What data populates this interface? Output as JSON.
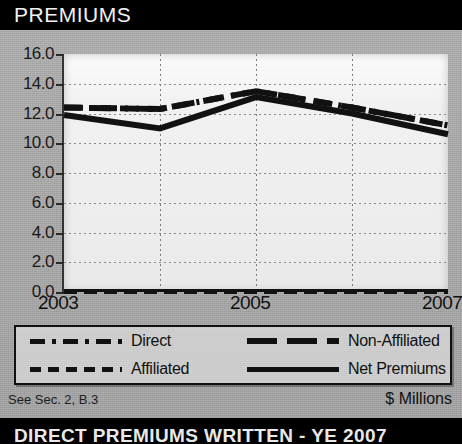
{
  "header": {
    "title": "PREMIUMS"
  },
  "footer": {
    "reference": "See Sec. 2, B.3",
    "units": "$ Millions",
    "bottom_banner": "DIRECT PREMIUMS WRITTEN - YE 2007"
  },
  "legend": {
    "entries": [
      {
        "label": "Direct",
        "style": "dash-dot",
        "name": "legend-item-direct"
      },
      {
        "label": "Non-Affiliated",
        "style": "long-dash",
        "name": "legend-item-non-affiliated"
      },
      {
        "label": "Affiliated",
        "style": "dashed",
        "name": "legend-item-affiliated"
      },
      {
        "label": "Net Premiums",
        "style": "solid",
        "name": "legend-item-net-premiums"
      }
    ]
  },
  "chart_data": {
    "type": "line",
    "title": "PREMIUMS",
    "xlabel": "",
    "ylabel": "",
    "units": "$ Millions",
    "x": [
      2003,
      2004,
      2005,
      2006,
      2007
    ],
    "tick_labels_x": [
      "2003",
      "2005",
      "2007"
    ],
    "tick_labels_y": [
      "0.0",
      "2.0",
      "4.0",
      "6.0",
      "8.0",
      "10.0",
      "12.0",
      "14.0",
      "16.0"
    ],
    "ylim": [
      0.0,
      16.0
    ],
    "ytick_step": 2.0,
    "grid": true,
    "legend_position": "below-plot",
    "series": [
      {
        "name": "Direct",
        "style": "dash-dot",
        "values": [
          12.4,
          12.3,
          13.5,
          12.4,
          11.2
        ]
      },
      {
        "name": "Non-Affiliated",
        "style": "long-dash",
        "values": [
          12.4,
          12.3,
          13.5,
          12.4,
          11.2
        ]
      },
      {
        "name": "Affiliated",
        "style": "dashed",
        "values": [
          0.0,
          0.0,
          0.0,
          0.0,
          0.0
        ]
      },
      {
        "name": "Net Premiums",
        "style": "solid",
        "values": [
          11.9,
          11.0,
          13.1,
          12.0,
          10.6
        ]
      }
    ]
  },
  "colors": {
    "header_bar": "#000000",
    "ink": "#111111",
    "paper": "#b0b0b0",
    "plot_bg": "#f1f1f1"
  }
}
